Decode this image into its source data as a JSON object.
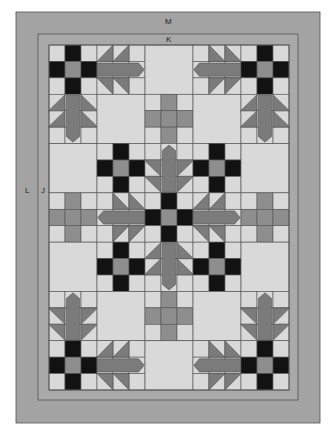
{
  "diagram": {
    "colors": {
      "background": "#ffffff",
      "border_outer": "#a3a3a3",
      "border_inner": "#a9a9a9",
      "seam": "#555555",
      "light": "#d9d9d9",
      "dark": "#121212",
      "medium": "#8e8e8e",
      "leaf": "#7b7b7b"
    },
    "labels": {
      "outer_border_top": "M",
      "inner_border_top": "K",
      "outer_border_side": "L",
      "inner_border_side": "J"
    },
    "geometry": {
      "outer": {
        "x": 16,
        "y": 12,
        "w": 304,
        "h": 411
      },
      "inner": {
        "x": 38,
        "y": 34,
        "w": 260,
        "h": 366
      },
      "quilt": {
        "x": 49,
        "y": 45,
        "w": 240,
        "h": 345
      },
      "block_cols": 5,
      "block_rows": 7
    },
    "blocks": [
      [
        "ninepatch",
        "leaf-right",
        "plain",
        "leaf-left",
        "ninepatch"
      ],
      [
        "leaf-down",
        "plain",
        "cross",
        "plain",
        "leaf-down"
      ],
      [
        "plain",
        "ninepatch",
        "leaf-up",
        "ninepatch",
        "plain"
      ],
      [
        "cross",
        "leaf-left",
        "ninepatch",
        "leaf-right",
        "cross"
      ],
      [
        "plain",
        "ninepatch",
        "leaf-down",
        "ninepatch",
        "plain"
      ],
      [
        "leaf-up",
        "plain",
        "cross",
        "plain",
        "leaf-up"
      ],
      [
        "ninepatch",
        "leaf-right",
        "plain",
        "leaf-left",
        "ninepatch"
      ]
    ]
  }
}
